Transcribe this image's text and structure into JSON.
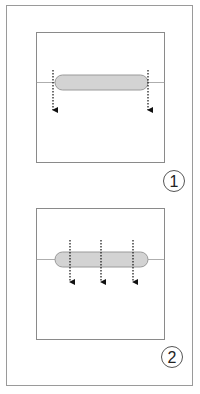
{
  "figure": {
    "panels": [
      {
        "label": "1",
        "arrow_count": 2
      },
      {
        "label": "2",
        "arrow_count": 3
      }
    ],
    "colors": {
      "frame": "#9a9a9a",
      "box": "#8a8a8a",
      "pill_fill": "#d3d3d3",
      "pill_stroke": "#9a9a9a",
      "arrow": "#111111"
    }
  }
}
